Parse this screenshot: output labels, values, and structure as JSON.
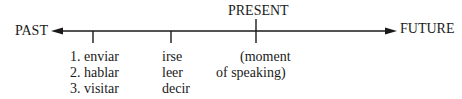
{
  "timeline": {
    "left_label": "PAST",
    "right_label": "FUTURE",
    "present_label": "PRESENT",
    "line_color": "#1a1a1a"
  },
  "markers": [
    {
      "name": "past-group-1",
      "items": [
        "1. enviar",
        "2. hablar",
        "3. visitar"
      ]
    },
    {
      "name": "past-group-2",
      "items": [
        "irse",
        "leer",
        "decir"
      ]
    },
    {
      "name": "present",
      "items": [
        "(moment",
        "of speaking)"
      ]
    }
  ]
}
